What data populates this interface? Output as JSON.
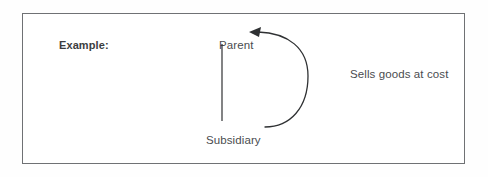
{
  "page": {
    "background_color": "#fefefe",
    "box_border_color": "#6f7174",
    "box_fill_color": "#ffffff"
  },
  "example_box": {
    "label": "Example:",
    "label_color": "#3b3d40"
  },
  "diagram": {
    "type": "relationship-flow",
    "stroke_color": "#2f3133",
    "text_color": "#4a4c4f",
    "nodes": [
      {
        "id": "parent",
        "label": "Parent"
      },
      {
        "id": "subsidiary",
        "label": "Subsidiary"
      }
    ],
    "connector": {
      "name": "ownership-line",
      "description": "vertical line linking Parent to Subsidiary"
    },
    "arrow": {
      "label": "Sells goods at cost",
      "from": "subsidiary",
      "to": "parent",
      "head": "solid-triangle",
      "direction": "left",
      "shape": "curved-c-open-left"
    }
  }
}
